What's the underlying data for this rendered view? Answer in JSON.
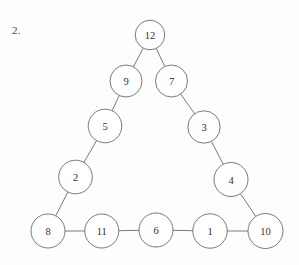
{
  "figure": {
    "problem_number": "2.",
    "shape": "triangle-of-circles",
    "stroke_color": "#6b6b6b",
    "fill_color": "#ffffff",
    "label_color": "#303030",
    "background_color": "#fdfdfd",
    "nodes": [
      {
        "id": "n12",
        "label": "12",
        "cx": 150.0,
        "cy": 35.0,
        "r": 14.8
      },
      {
        "id": "n9",
        "label": "9",
        "cx": 126.0,
        "cy": 81.0,
        "r": 16.0
      },
      {
        "id": "n7",
        "label": "7",
        "cx": 171.5,
        "cy": 81.0,
        "r": 16.0
      },
      {
        "id": "n5",
        "label": "5",
        "cx": 105.0,
        "cy": 126.0,
        "r": 16.8
      },
      {
        "id": "n3",
        "label": "3",
        "cx": 204.0,
        "cy": 127.0,
        "r": 16.2
      },
      {
        "id": "n2",
        "label": "2",
        "cx": 75.5,
        "cy": 177.0,
        "r": 16.8
      },
      {
        "id": "n4",
        "label": "4",
        "cx": 231.0,
        "cy": 179.5,
        "r": 17.0
      },
      {
        "id": "n8",
        "label": "8",
        "cx": 48.0,
        "cy": 231.0,
        "r": 17.0
      },
      {
        "id": "n11",
        "label": "11",
        "cx": 101.8,
        "cy": 231.0,
        "r": 17.0
      },
      {
        "id": "n6",
        "label": "6",
        "cx": 156.0,
        "cy": 230.0,
        "r": 17.0
      },
      {
        "id": "n1",
        "label": "1",
        "cx": 210.0,
        "cy": 231.0,
        "r": 17.2
      },
      {
        "id": "n10",
        "label": "10",
        "cx": 265.5,
        "cy": 231.0,
        "r": 17.5
      }
    ],
    "edges": [
      {
        "from": "n12",
        "to": "n9",
        "side": "left"
      },
      {
        "from": "n9",
        "to": "n5",
        "side": "left"
      },
      {
        "from": "n5",
        "to": "n2",
        "side": "left"
      },
      {
        "from": "n2",
        "to": "n8",
        "side": "left"
      },
      {
        "from": "n8",
        "to": "n11",
        "side": "bottom"
      },
      {
        "from": "n11",
        "to": "n6",
        "side": "bottom"
      },
      {
        "from": "n6",
        "to": "n1",
        "side": "bottom"
      },
      {
        "from": "n1",
        "to": "n10",
        "side": "bottom"
      },
      {
        "from": "n10",
        "to": "n4",
        "side": "right"
      },
      {
        "from": "n4",
        "to": "n3",
        "side": "right"
      },
      {
        "from": "n3",
        "to": "n7",
        "side": "right"
      },
      {
        "from": "n7",
        "to": "n12",
        "side": "right"
      }
    ],
    "sides": {
      "left": [
        "12",
        "9",
        "5",
        "2",
        "8"
      ],
      "bottom": [
        "8",
        "11",
        "6",
        "1",
        "10"
      ],
      "right": [
        "10",
        "4",
        "3",
        "7",
        "12"
      ]
    }
  }
}
